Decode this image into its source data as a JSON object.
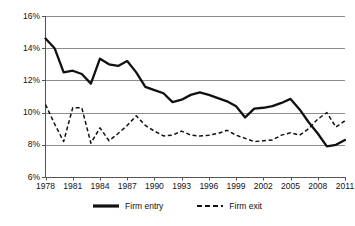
{
  "chart_data": {
    "type": "line",
    "title": "",
    "xlabel": "",
    "ylabel": "",
    "xlim": [
      1978,
      2011
    ],
    "ylim": [
      6,
      16
    ],
    "grid": true,
    "grid_axis": "y",
    "legend_position": "bottom",
    "y_ticks": [
      "6%",
      "8%",
      "10%",
      "12%",
      "14%",
      "16%"
    ],
    "y_tick_values": [
      6,
      8,
      10,
      12,
      14,
      16
    ],
    "x_ticks": [
      "1978",
      "1981",
      "1984",
      "1987",
      "1990",
      "1993",
      "1996",
      "1999",
      "2002",
      "2005",
      "2008",
      "2011"
    ],
    "x_tick_values": [
      1978,
      1981,
      1984,
      1987,
      1990,
      1993,
      1996,
      1999,
      2002,
      2005,
      2008,
      2011
    ],
    "x": [
      1978,
      1979,
      1980,
      1981,
      1982,
      1983,
      1984,
      1985,
      1986,
      1987,
      1988,
      1989,
      1990,
      1991,
      1992,
      1993,
      1994,
      1995,
      1996,
      1997,
      1998,
      1999,
      2000,
      2001,
      2002,
      2003,
      2004,
      2005,
      2006,
      2007,
      2008,
      2009,
      2010,
      2011
    ],
    "series": [
      {
        "name": "Firm entry",
        "style": "solid",
        "color": "#111111",
        "values": [
          14.6,
          14.0,
          12.5,
          12.6,
          12.4,
          11.8,
          13.35,
          13.0,
          12.9,
          13.2,
          12.5,
          11.6,
          11.4,
          11.2,
          10.65,
          10.8,
          11.1,
          11.25,
          11.1,
          10.9,
          10.7,
          10.4,
          9.7,
          10.25,
          10.3,
          10.4,
          10.6,
          10.85,
          10.2,
          9.4,
          8.7,
          7.9,
          8.0,
          8.3
        ]
      },
      {
        "name": "Firm exit",
        "style": "dashed",
        "color": "#111111",
        "values": [
          10.5,
          9.3,
          8.2,
          10.3,
          10.3,
          8.1,
          9.05,
          8.25,
          8.7,
          9.2,
          9.8,
          9.2,
          8.85,
          8.55,
          8.6,
          8.85,
          8.6,
          8.55,
          8.6,
          8.7,
          8.9,
          8.6,
          8.4,
          8.2,
          8.25,
          8.3,
          8.6,
          8.75,
          8.6,
          9.0,
          9.6,
          10.0,
          9.1,
          9.5
        ]
      }
    ]
  },
  "legend": {
    "entries": [
      {
        "label": "Firm entry",
        "style": "solid"
      },
      {
        "label": "Firm exit",
        "style": "dashed"
      }
    ]
  }
}
